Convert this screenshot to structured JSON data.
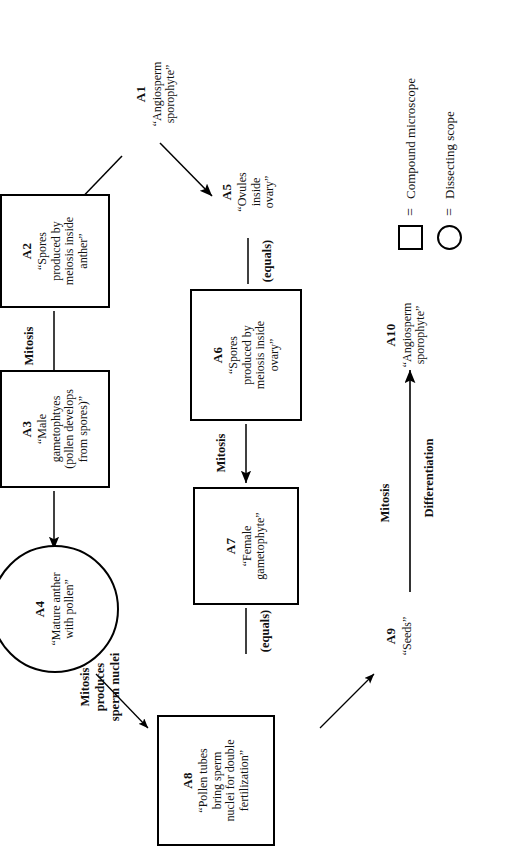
{
  "diagram": {
    "nodes": [
      {
        "id": "A1",
        "label": "A1",
        "text": "“Angiosperm\nsporophyte”",
        "shape": "none"
      },
      {
        "id": "A2",
        "label": "A2",
        "text": "“Spores\nproduced by\nmeiosis inside\nanther”",
        "shape": "box"
      },
      {
        "id": "A3",
        "label": "A3",
        "text": "“Male\ngametophtyes\n(pollen develops\nfrom spores)”",
        "shape": "box"
      },
      {
        "id": "A4",
        "label": "A4",
        "text": "“Mature anther\nwith pollen”",
        "shape": "circle"
      },
      {
        "id": "A5",
        "label": "A5",
        "text": "“Ovules\ninside\novary”",
        "shape": "none"
      },
      {
        "id": "A6",
        "label": "A6",
        "text": "“Spores\nproduced by\nmeiosis inside\novary”",
        "shape": "box"
      },
      {
        "id": "A7",
        "label": "A7",
        "text": "“Female\ngametophyte”",
        "shape": "box"
      },
      {
        "id": "A8",
        "label": "A8",
        "text": "“Pollen tubes\nbring sperm\nnuclei for double\nfertilization”",
        "shape": "box"
      },
      {
        "id": "A9",
        "label": "A9",
        "text": "“Seeds”",
        "shape": "none"
      },
      {
        "id": "A10",
        "label": "A10",
        "text": "“Angiosperm\nsporophyte”",
        "shape": "none"
      }
    ],
    "edge_labels": {
      "a2_to_a3": "Mitosis",
      "a4_to_a8": "Mitosis\nproduces\nsperm nuclei",
      "a6_to_a7": "Mitosis",
      "a9_to_a10_top": "Mitosis",
      "a9_to_a10_bottom": "Differentiation",
      "equals_a5_a6": "(equals)",
      "equals_a7_a8": "(equals)"
    }
  },
  "legend": {
    "rows": [
      {
        "shape": "square",
        "equals": "=",
        "text": "Compound microscope"
      },
      {
        "shape": "circle",
        "equals": "=",
        "text": "Dissecting scope"
      }
    ]
  }
}
